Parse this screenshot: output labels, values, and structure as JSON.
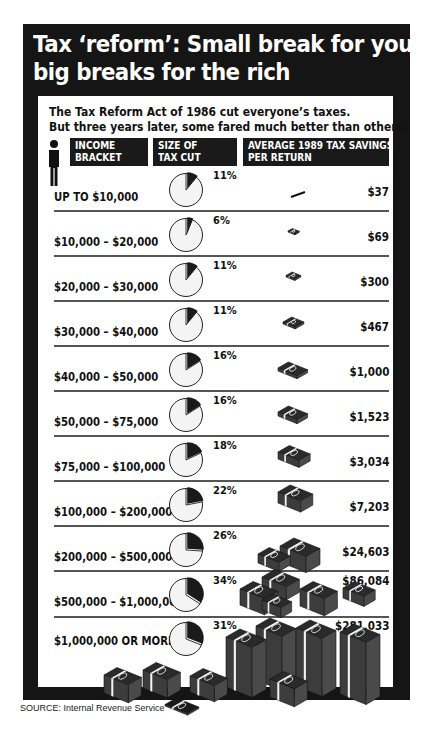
{
  "title": {
    "line1": "Tax ‘reform’: Small break for you,",
    "line2": "big breaks for the rich"
  },
  "subtitle": {
    "line1": "The Tax Reform Act of 1986 cut everyone’s taxes.",
    "line2": "But three years later, some fared much better than others:"
  },
  "headers": {
    "income": {
      "line1": "INCOME",
      "line2": "BRACKET"
    },
    "size": {
      "line1": "SIZE OF",
      "line2": "TAX CUT"
    },
    "savings": {
      "line1": "AVERAGE 1989 TAX SAVINGS",
      "line2": "PER RETURN"
    }
  },
  "icons": {
    "header": "person-icon",
    "size_column": "pie-chart-icon",
    "savings_column": "money-stack-icon"
  },
  "rows": [
    {
      "bracket": "UP TO $10,000",
      "pct": "11%",
      "savings": "$37"
    },
    {
      "bracket": "$10,000 – $20,000",
      "pct": "6%",
      "savings": "$69"
    },
    {
      "bracket": "$20,000 – $30,000",
      "pct": "11%",
      "savings": "$300"
    },
    {
      "bracket": "$30,000 – $40,000",
      "pct": "11%",
      "savings": "$467"
    },
    {
      "bracket": "$40,000 – $50,000",
      "pct": "16%",
      "savings": "$1,000"
    },
    {
      "bracket": "$50,000 – $75,000",
      "pct": "16%",
      "savings": "$1,523"
    },
    {
      "bracket": "$75,000 – $100,000",
      "pct": "18%",
      "savings": "$3,034"
    },
    {
      "bracket": "$100,000 – $200,000",
      "pct": "22%",
      "savings": "$7,203"
    },
    {
      "bracket": "$200,000 – $500,000",
      "pct": "26%",
      "savings": "$24,603"
    },
    {
      "bracket": "$500,000 – $1,000,000",
      "pct": "34%",
      "savings": "$86,084"
    },
    {
      "bracket": "$1,000,000 OR MORE",
      "pct": "31%",
      "savings": "$281,033"
    }
  ],
  "source": "SOURCE: Internal Revenue Service",
  "colors": {
    "frame": "#151515",
    "panel": "#ffffff",
    "pie_fill": "#f4f4f4",
    "pie_wedge": "#1a1a1a",
    "money": "#3a3a3a",
    "text": "#111111"
  },
  "chart_data": {
    "type": "table",
    "title": "Tax ‘reform’: Small break for you, big breaks for the rich",
    "subtitle": "The Tax Reform Act of 1986 cut everyone’s taxes. But three years later, some fared much better than others:",
    "columns": [
      "Income bracket",
      "Size of tax cut",
      "Average 1989 tax savings per return"
    ],
    "categories": [
      "Up to $10,000",
      "$10,000–$20,000",
      "$20,000–$30,000",
      "$30,000–$40,000",
      "$40,000–$50,000",
      "$50,000–$75,000",
      "$75,000–$100,000",
      "$100,000–$200,000",
      "$200,000–$500,000",
      "$500,000–$1,000,000",
      "$1,000,000 or more"
    ],
    "series": [
      {
        "name": "Size of tax cut (%)",
        "values": [
          11,
          6,
          11,
          11,
          16,
          16,
          18,
          22,
          26,
          34,
          31
        ],
        "visual": "pie"
      },
      {
        "name": "Average 1989 tax savings per return ($)",
        "values": [
          37,
          69,
          300,
          467,
          1000,
          1523,
          3034,
          7203,
          24603,
          86084,
          281033
        ],
        "visual": "money stacks"
      }
    ],
    "source": "Internal Revenue Service"
  }
}
